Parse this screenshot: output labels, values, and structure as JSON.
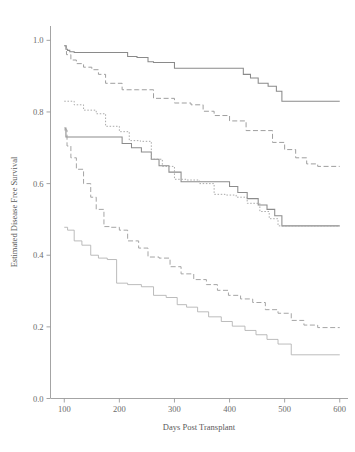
{
  "chart_data": {
    "type": "line",
    "title": "",
    "xlabel": "Days Post Transplant",
    "ylabel": "Estimated Disease Free Survival",
    "xlim": [
      75,
      615
    ],
    "ylim": [
      0.0,
      1.04
    ],
    "xticks": [
      100,
      200,
      300,
      400,
      500,
      600
    ],
    "xtick_labels": [
      "100",
      "200",
      "300",
      "400",
      "500",
      "600"
    ],
    "yticks": [
      0.0,
      0.2,
      0.4,
      0.6,
      0.8,
      1.0
    ],
    "ytick_labels": [
      "0.0",
      "0.2",
      "0.4",
      "0.6",
      "0.8",
      "1.0"
    ],
    "grid": false,
    "legend": "none",
    "step_type": "post",
    "series": [
      {
        "name": "curve-1-solid-upper",
        "style": "solid",
        "color": "#8a8a8a",
        "x": [
          100,
          103,
          106,
          110,
          118,
          205,
          215,
          232,
          252,
          262,
          300,
          410,
          425,
          438,
          452,
          470,
          485,
          495,
          600
        ],
        "y": [
          0.985,
          0.975,
          0.972,
          0.968,
          0.966,
          0.966,
          0.955,
          0.952,
          0.94,
          0.938,
          0.922,
          0.922,
          0.905,
          0.895,
          0.88,
          0.872,
          0.858,
          0.83,
          0.83
        ]
      },
      {
        "name": "curve-2-dashed-upper",
        "style": "dashed",
        "color": "#9a9a9a",
        "x": [
          100,
          104,
          112,
          122,
          135,
          150,
          162,
          175,
          205,
          235,
          262,
          300,
          330,
          352,
          372,
          400,
          430,
          455,
          478,
          500,
          520,
          540,
          560,
          600
        ],
        "y": [
          0.985,
          0.96,
          0.945,
          0.935,
          0.925,
          0.918,
          0.905,
          0.88,
          0.862,
          0.862,
          0.838,
          0.825,
          0.82,
          0.802,
          0.79,
          0.775,
          0.748,
          0.748,
          0.715,
          0.695,
          0.672,
          0.655,
          0.648,
          0.648
        ]
      },
      {
        "name": "curve-3-solid-middle",
        "style": "solid",
        "color": "#8c8c8c",
        "x": [
          100,
          103,
          180,
          205,
          222,
          240,
          258,
          272,
          290,
          312,
          352,
          400,
          415,
          432,
          452,
          468,
          482,
          495,
          600
        ],
        "y": [
          0.755,
          0.73,
          0.73,
          0.712,
          0.7,
          0.688,
          0.668,
          0.65,
          0.632,
          0.605,
          0.605,
          0.592,
          0.575,
          0.558,
          0.54,
          0.528,
          0.51,
          0.482,
          0.482
        ]
      },
      {
        "name": "curve-4-dotted-middle",
        "style": "dotted",
        "color": "#a5a5a5",
        "x": [
          100,
          118,
          135,
          158,
          175,
          200,
          218,
          238,
          258,
          278,
          300,
          322,
          345,
          372,
          392,
          412,
          432,
          455,
          472,
          488,
          600
        ],
        "y": [
          0.83,
          0.82,
          0.805,
          0.795,
          0.76,
          0.745,
          0.72,
          0.718,
          0.668,
          0.648,
          0.612,
          0.61,
          0.6,
          0.57,
          0.568,
          0.562,
          0.545,
          0.522,
          0.502,
          0.482,
          0.482
        ]
      },
      {
        "name": "curve-5-dashed-lower",
        "style": "dashed",
        "color": "#a0a0a0",
        "x": [
          100,
          105,
          112,
          122,
          135,
          148,
          158,
          172,
          185,
          200,
          215,
          235,
          252,
          272,
          292,
          312,
          335,
          358,
          378,
          398,
          420,
          442,
          465,
          488,
          512,
          535,
          560,
          600
        ],
        "y": [
          0.75,
          0.705,
          0.672,
          0.64,
          0.6,
          0.562,
          0.528,
          0.48,
          0.478,
          0.47,
          0.44,
          0.42,
          0.395,
          0.392,
          0.368,
          0.348,
          0.332,
          0.318,
          0.302,
          0.288,
          0.278,
          0.268,
          0.248,
          0.238,
          0.218,
          0.205,
          0.198,
          0.198
        ]
      },
      {
        "name": "curve-6-solid-lower",
        "style": "solid-thin",
        "color": "#b0b0b0",
        "x": [
          100,
          106,
          118,
          132,
          148,
          162,
          178,
          195,
          215,
          240,
          262,
          285,
          305,
          322,
          342,
          362,
          385,
          405,
          428,
          448,
          468,
          488,
          512,
          600
        ],
        "y": [
          0.478,
          0.47,
          0.44,
          0.428,
          0.4,
          0.392,
          0.388,
          0.322,
          0.318,
          0.312,
          0.288,
          0.282,
          0.262,
          0.255,
          0.242,
          0.228,
          0.215,
          0.202,
          0.19,
          0.178,
          0.165,
          0.152,
          0.122,
          0.122
        ]
      }
    ]
  },
  "axes": {
    "y_axis_title": "Estimated Disease Free Survival",
    "x_axis_title": "Days Post Transplant"
  }
}
